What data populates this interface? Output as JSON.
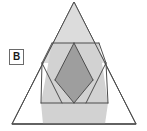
{
  "figure": {
    "label": {
      "text": "B",
      "name": "panel-label-b"
    },
    "background_color": "#ffffff",
    "stroke_color": "#4d4d4d",
    "shapes": {
      "outer_triangle": {
        "name": "outer-triangle",
        "fill": "#ffffff",
        "points": "74,2 136,124 12,124"
      },
      "upper_triangle": {
        "name": "upper-shaded-triangle",
        "fill": "#dcdcdc",
        "points": "74,2 105,63 43,63"
      },
      "inner_hexagon": {
        "name": "inner-shaded-hexagon",
        "fill": "#d2d2d2",
        "points": "52,43 99,43 108,103 41,103"
      },
      "center_diamond": {
        "name": "center-dark-diamond",
        "fill": "#9e9e9e",
        "points": "74,43 93,80 74,103 55,80"
      },
      "lower_band": {
        "name": "lower-shaded-band",
        "fill": "#d2d2d2",
        "points": "41,103 108,103 105,124 43,124"
      }
    },
    "guide_lines": [
      {
        "name": "upper-horizontal-chord",
        "x1": 52,
        "y1": 43,
        "x2": 99,
        "y2": 43
      },
      {
        "name": "lower-horizontal-chord",
        "x1": 41,
        "y1": 103,
        "x2": 108,
        "y2": 103
      },
      {
        "name": "left-diagonal-down",
        "x1": 52,
        "y1": 43,
        "x2": 42,
        "y2": 63
      },
      {
        "name": "left-diagonal-up",
        "x1": 42,
        "y1": 63,
        "x2": 41,
        "y2": 103
      },
      {
        "name": "right-diagonal-down",
        "x1": 99,
        "y1": 43,
        "x2": 106,
        "y2": 63
      },
      {
        "name": "right-diagonal-up",
        "x1": 106,
        "y1": 63,
        "x2": 108,
        "y2": 103
      },
      {
        "name": "diamond-upper-left-edge",
        "x1": 74,
        "y1": 43,
        "x2": 55,
        "y2": 80
      },
      {
        "name": "diamond-upper-right-edge",
        "x1": 74,
        "y1": 43,
        "x2": 93,
        "y2": 80
      },
      {
        "name": "diamond-lower-left-edge",
        "x1": 55,
        "y1": 80,
        "x2": 74,
        "y2": 103
      },
      {
        "name": "diamond-lower-right-edge",
        "x1": 93,
        "y1": 80,
        "x2": 74,
        "y2": 103
      },
      {
        "name": "left-inner-vee-left-leg",
        "x1": 42,
        "y1": 63,
        "x2": 62,
        "y2": 103
      },
      {
        "name": "right-inner-vee-right-leg",
        "x1": 106,
        "y1": 63,
        "x2": 86,
        "y2": 103
      },
      {
        "name": "base-line",
        "x1": 12,
        "y1": 124,
        "x2": 136,
        "y2": 124
      }
    ]
  }
}
